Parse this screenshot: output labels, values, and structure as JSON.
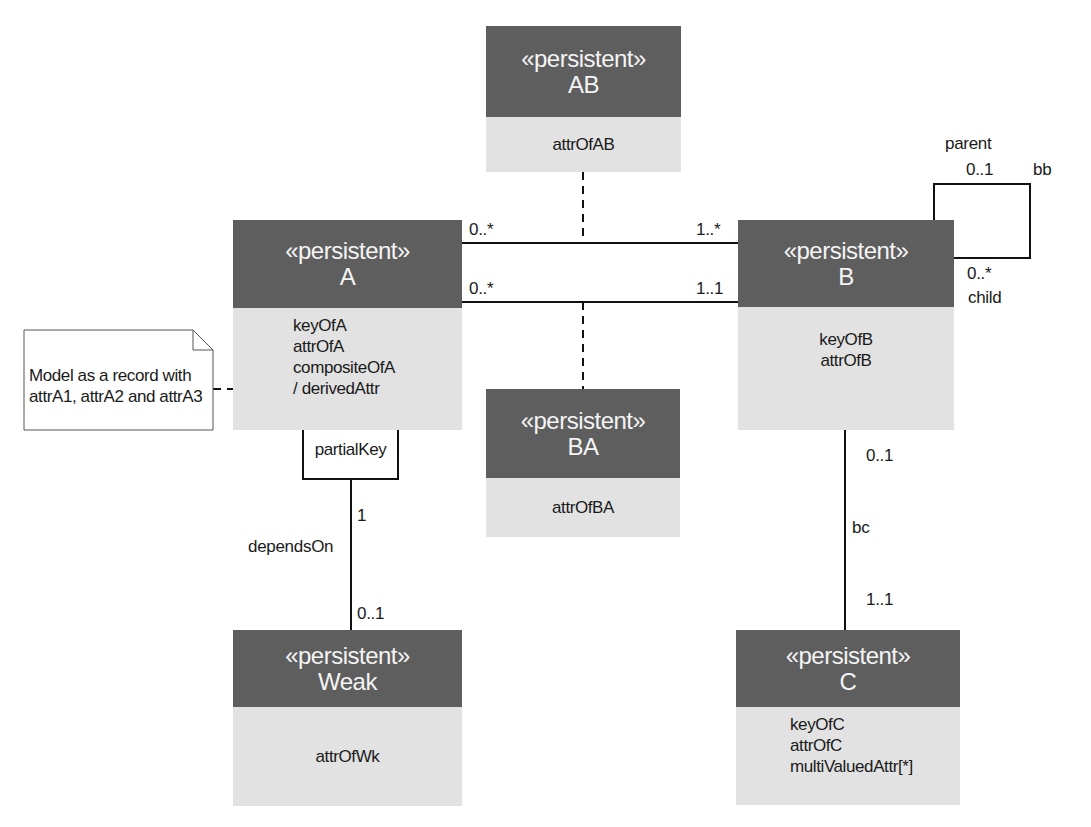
{
  "diagram": {
    "type": "UML class diagram",
    "classes": {
      "AB": {
        "stereotype": "«persistent»",
        "name": "AB",
        "attributes": [
          "attrOfAB"
        ]
      },
      "A": {
        "stereotype": "«persistent»",
        "name": "A",
        "attributes": [
          "keyOfA",
          "attrOfA",
          "compositeOfA",
          "/ derivedAttr"
        ]
      },
      "B": {
        "stereotype": "«persistent»",
        "name": "B",
        "attributes": [
          "keyOfB",
          "attrOfB"
        ]
      },
      "BA": {
        "stereotype": "«persistent»",
        "name": "BA",
        "attributes": [
          "attrOfBA"
        ]
      },
      "Weak": {
        "stereotype": "«persistent»",
        "name": "Weak",
        "attributes": [
          "attrOfWk"
        ]
      },
      "C": {
        "stereotype": "«persistent»",
        "name": "C",
        "attributes": [
          "keyOfC",
          "attrOfC",
          "multiValuedAttr[*]"
        ]
      }
    },
    "associations": {
      "a_b_top": {
        "from": "A",
        "to": "B",
        "from_mult": "0..*",
        "to_mult": "1..*",
        "association_class": "AB"
      },
      "a_b_bottom": {
        "from": "A",
        "to": "B",
        "from_mult": "0..*",
        "to_mult": "1..1",
        "association_class": "BA"
      },
      "bb": {
        "name": "bb",
        "from": "B",
        "to": "B",
        "parent_role": "parent",
        "parent_mult": "0..1",
        "child_role": "child",
        "child_mult": "0..*"
      },
      "bc": {
        "name": "bc",
        "from": "B",
        "to": "C",
        "b_mult": "0..1",
        "c_mult": "1..1"
      },
      "dependsOn": {
        "name": "dependsOn",
        "from": "A",
        "to": "Weak",
        "qualifier": "partialKey",
        "a_mult": "1",
        "weak_mult": "0..1"
      }
    },
    "note": {
      "lines": [
        "Model as a record with",
        "attrA1, attrA2 and attrA3"
      ],
      "attached_to": "compositeOfA"
    }
  },
  "colors": {
    "header": "#5e5e5e",
    "body": "#e2e2e2",
    "header_text": "#f4f4f4",
    "line": "#111111"
  }
}
